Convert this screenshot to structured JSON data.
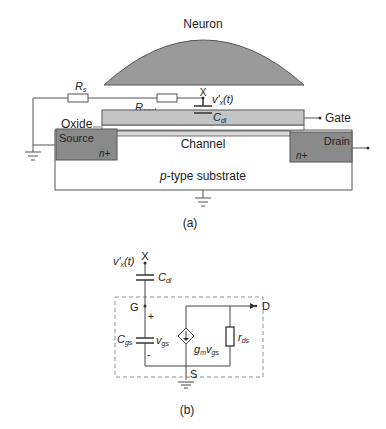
{
  "figure_a": {
    "caption": "(a)",
    "neuron_label": "Neuron",
    "rs_label": "R",
    "rs_sub": "s",
    "rseal_label": "R",
    "rseal_sub": "seal",
    "node_x_label": "X",
    "vx_label": "v'",
    "vx_sub": "x",
    "vx_suffix": "(t)",
    "cdl_label": "C",
    "cdl_sub": "dl",
    "gate_label": "Gate",
    "oxide_label": "Oxide",
    "source_label": "Source",
    "drain_label": "Drain",
    "source_doping": "n+",
    "drain_doping": "n+",
    "channel_label": "Channel",
    "substrate_italic": "p",
    "substrate_rest": "-type substrate"
  },
  "figure_b": {
    "caption": "(b)",
    "node_x_label": "X",
    "vx_label": "v'",
    "vx_sub": "x",
    "vx_suffix": "(t)",
    "cdl_label": "C",
    "cdl_sub": "dl",
    "gate_node": "G",
    "drain_node": "D",
    "source_node": "S",
    "plus": "+",
    "minus": "-",
    "cgs_label": "C",
    "cgs_sub": "gs",
    "vgs_label": "v",
    "vgs_sub": "gs",
    "gm_label": "g",
    "gm_sub": "m",
    "gm_v": "v",
    "gm_vsub": "gs",
    "rds_label": "r",
    "rds_sub": "ds"
  },
  "colors": {
    "neuron_fill": "#9a9a9a",
    "gate_fill": "#c4c4c4",
    "sd_fill": "#8a8a8a",
    "channel_fill": "#d8d8d8",
    "line": "#444444"
  }
}
